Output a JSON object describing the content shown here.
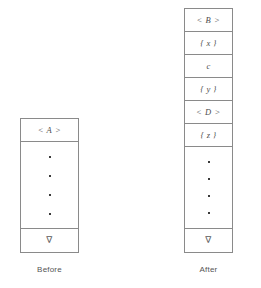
{
  "figure": {
    "title": "",
    "colors": {
      "border": "#8a8a8a",
      "text": "#4d4d4d",
      "dot": "#3a3a3a",
      "background": "#ffffff"
    }
  },
  "before": {
    "caption": "Before",
    "header": "< A >",
    "body_dots": [
      "•",
      "•",
      "•",
      "•"
    ],
    "bottom": "∇"
  },
  "after": {
    "caption": "After",
    "elements": [
      {
        "label": "< B >",
        "kind": "angle"
      },
      {
        "label": "{ x }",
        "kind": "brace"
      },
      {
        "label": "c",
        "kind": "plain"
      },
      {
        "label": "{ y }",
        "kind": "brace"
      },
      {
        "label": "< D >",
        "kind": "angle"
      },
      {
        "label": "{ z }",
        "kind": "brace"
      }
    ],
    "body_dots": [
      "•",
      "•",
      "•",
      "•"
    ],
    "bottom": "∇"
  }
}
